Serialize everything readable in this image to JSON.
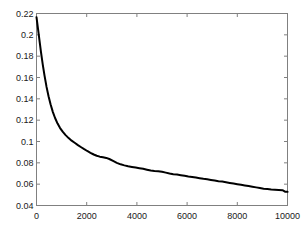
{
  "chart_data": {
    "type": "line",
    "title": "",
    "xlabel": "",
    "ylabel": "",
    "xlim": [
      0,
      10000
    ],
    "ylim": [
      0.04,
      0.22
    ],
    "grid": false,
    "legend": null,
    "xticks": [
      0,
      2000,
      4000,
      6000,
      8000,
      10000
    ],
    "xticklabels": [
      "0",
      "2000",
      "4000",
      "6000",
      "8000",
      "10000"
    ],
    "yticks": [
      0.04,
      0.06,
      0.08,
      0.1,
      0.12,
      0.14,
      0.16,
      0.18,
      0.2,
      0.22
    ],
    "yticklabels": [
      "0.04",
      "0.06",
      "0.08",
      "0.1",
      "0.12",
      "0.14",
      "0.16",
      "0.18",
      "0.2",
      "0.22"
    ],
    "line_color": "#000000",
    "line_width": 2,
    "axis_color": "#808080",
    "background_color": "#ffffff",
    "series": [
      {
        "name": "error",
        "x": [
          0,
          60,
          120,
          180,
          250,
          320,
          400,
          480,
          560,
          650,
          740,
          840,
          940,
          1050,
          1160,
          1280,
          1400,
          1520,
          1650,
          1780,
          1900,
          2020,
          2150,
          2280,
          2400,
          2520,
          2650,
          2780,
          2900,
          3050,
          3200,
          3350,
          3500,
          3650,
          3800,
          3950,
          4100,
          4250,
          4400,
          4550,
          4700,
          4850,
          5000,
          5150,
          5300,
          5450,
          5600,
          5750,
          5900,
          6050,
          6200,
          6350,
          6500,
          6650,
          6800,
          6950,
          7100,
          7250,
          7400,
          7550,
          7700,
          7850,
          8000,
          8150,
          8300,
          8450,
          8600,
          8750,
          8900,
          9050,
          9200,
          9350,
          9500,
          9650,
          9800,
          9900,
          10000
        ],
        "y": [
          0.2165,
          0.2055,
          0.1945,
          0.1835,
          0.172,
          0.1618,
          0.1512,
          0.1424,
          0.1349,
          0.1278,
          0.122,
          0.1168,
          0.1126,
          0.109,
          0.106,
          0.1032,
          0.1008,
          0.0988,
          0.0966,
          0.0946,
          0.0928,
          0.0911,
          0.0894,
          0.0878,
          0.0866,
          0.0858,
          0.0852,
          0.0846,
          0.0836,
          0.0818,
          0.08,
          0.0786,
          0.0776,
          0.0768,
          0.0762,
          0.0756,
          0.075,
          0.0744,
          0.0736,
          0.0728,
          0.0724,
          0.0722,
          0.0716,
          0.0708,
          0.07,
          0.0694,
          0.069,
          0.0684,
          0.0678,
          0.0672,
          0.0668,
          0.0662,
          0.0656,
          0.065,
          0.0646,
          0.064,
          0.0634,
          0.0628,
          0.0624,
          0.0618,
          0.0612,
          0.0606,
          0.06,
          0.0594,
          0.0588,
          0.0582,
          0.0576,
          0.057,
          0.0564,
          0.0558,
          0.0554,
          0.055,
          0.0548,
          0.0546,
          0.0544,
          0.053,
          0.0528
        ]
      }
    ]
  }
}
